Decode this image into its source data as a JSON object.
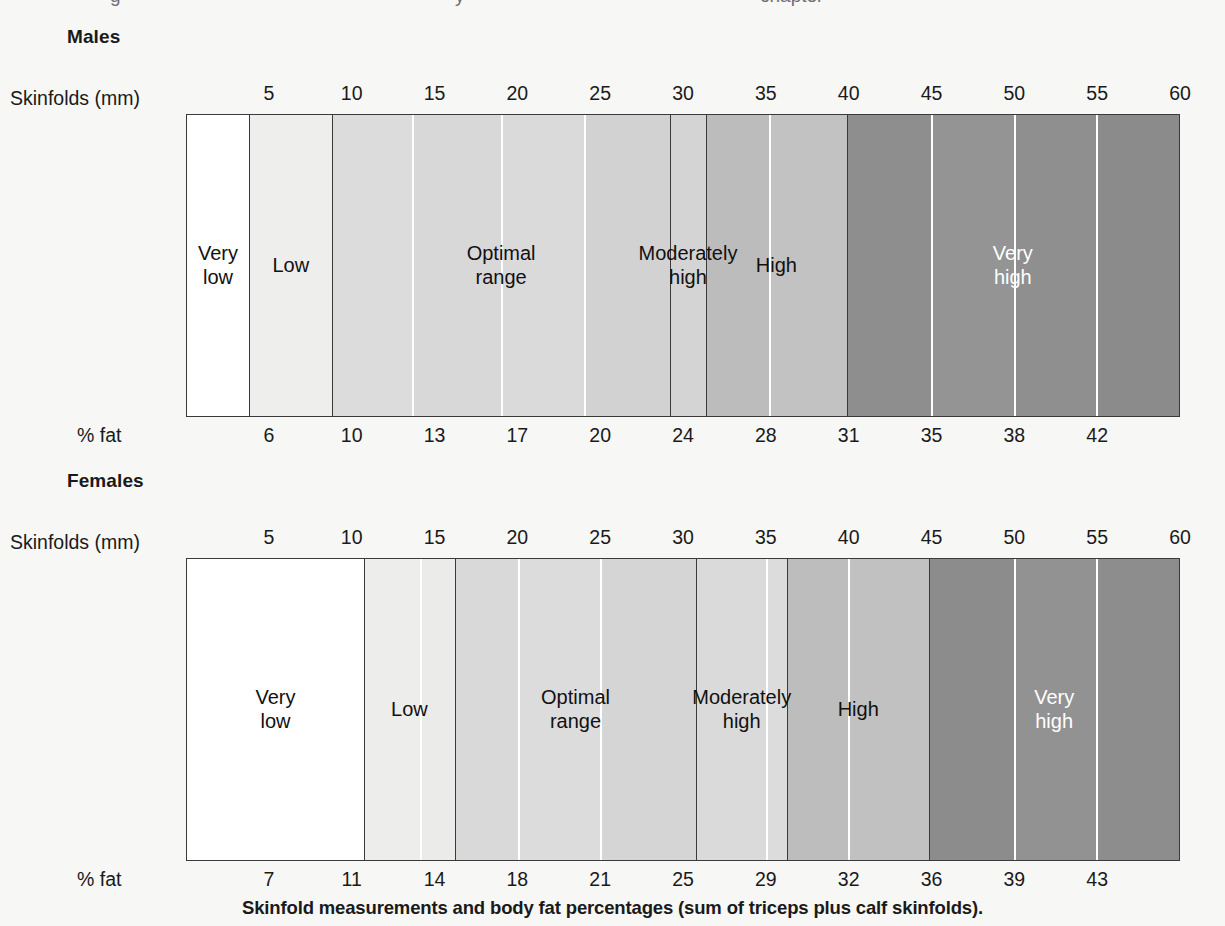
{
  "page": {
    "background": "#f7f7f5",
    "caption": "Skinfold measurements and body fat percentages (sum of triceps plus calf skinfolds).",
    "cutoff_top": {
      "a": "g",
      "b": "y",
      "c": "chapter"
    }
  },
  "axis": {
    "skinfold_label": "Skinfolds (mm)",
    "pct_label": "% fat",
    "min": 0,
    "max": 60,
    "ticks": [
      5,
      10,
      15,
      20,
      25,
      30,
      35,
      40,
      45,
      50,
      55,
      60
    ]
  },
  "palette": {
    "white": "#ffffff",
    "shade1": "#ededeb",
    "shade2": "#dedede",
    "shade3": "#d7d7d7",
    "shade4": "#dcdcdc",
    "shade5": "#d2d2d2",
    "shade6": "#bdbdbd",
    "shade7": "#c2c2c2",
    "shade8": "#8f8f8f",
    "shade9": "#949494",
    "shade10": "#8d8d8d",
    "shade11": "#8a8a8a",
    "border": "#3a3a3a",
    "divider_white": "#ffffff",
    "text_dark": "#111111",
    "text_light": "#ffffff"
  },
  "charts": [
    {
      "id": "males",
      "title": "Males",
      "pct_ticks": [
        6,
        10,
        13,
        17,
        20,
        24,
        28,
        31,
        35,
        38,
        42
      ],
      "pct_tick_mm": [
        5,
        10,
        15,
        20,
        25,
        30,
        35,
        40,
        45,
        50,
        55
      ],
      "categories": [
        {
          "name": "Very low",
          "label": "Very\nlow",
          "from_mm": 0,
          "to_mm": 3.75,
          "text": "dark"
        },
        {
          "name": "Low",
          "label": "Low",
          "from_mm": 3.75,
          "to_mm": 8.8,
          "text": "dark"
        },
        {
          "name": "Optimal range",
          "label": "Optimal\nrange",
          "from_mm": 8.8,
          "to_mm": 29.2,
          "text": "dark"
        },
        {
          "name": "Moderately high",
          "label": "Moderately\nhigh",
          "from_mm": 29.2,
          "to_mm": 31.4,
          "text": "dark"
        },
        {
          "name": "High",
          "label": "High",
          "from_mm": 31.4,
          "to_mm": 39.9,
          "text": "dark"
        },
        {
          "name": "Very high",
          "label": "Very\nhigh",
          "from_mm": 39.9,
          "to_mm": 60,
          "text": "light"
        }
      ],
      "bands": [
        {
          "from_mm": 0,
          "to_mm": 3.75,
          "color": "#ffffff",
          "sep": "none"
        },
        {
          "from_mm": 3.75,
          "to_mm": 8.8,
          "color": "#eeeeec",
          "sep": "major"
        },
        {
          "from_mm": 8.8,
          "to_mm": 13.6,
          "color": "#dcdcdc",
          "sep": "major"
        },
        {
          "from_mm": 13.6,
          "to_mm": 19.0,
          "color": "#d8d8d8",
          "sep": "minor"
        },
        {
          "from_mm": 19.0,
          "to_mm": 24.0,
          "color": "#dadada",
          "sep": "minor"
        },
        {
          "from_mm": 24.0,
          "to_mm": 29.2,
          "color": "#d2d2d2",
          "sep": "minor"
        },
        {
          "from_mm": 29.2,
          "to_mm": 31.4,
          "color": "#d4d4d4",
          "sep": "major"
        },
        {
          "from_mm": 31.4,
          "to_mm": 35.2,
          "color": "#bcbcbc",
          "sep": "major"
        },
        {
          "from_mm": 35.2,
          "to_mm": 39.9,
          "color": "#c2c2c2",
          "sep": "minor"
        },
        {
          "from_mm": 39.9,
          "to_mm": 45.0,
          "color": "#8e8e8e",
          "sep": "major"
        },
        {
          "from_mm": 45.0,
          "to_mm": 50.0,
          "color": "#949494",
          "sep": "minor"
        },
        {
          "from_mm": 50.0,
          "to_mm": 55.0,
          "color": "#8f8f8f",
          "sep": "minor"
        },
        {
          "from_mm": 55.0,
          "to_mm": 60.0,
          "color": "#8b8b8b",
          "sep": "minor"
        }
      ]
    },
    {
      "id": "females",
      "title": "Females",
      "pct_ticks": [
        7,
        11,
        14,
        18,
        21,
        25,
        29,
        32,
        36,
        39,
        43
      ],
      "pct_tick_mm": [
        5,
        10,
        15,
        20,
        25,
        30,
        35,
        40,
        45,
        50,
        55
      ],
      "categories": [
        {
          "name": "Very low",
          "label": "Very\nlow",
          "from_mm": 0,
          "to_mm": 10.7,
          "text": "dark"
        },
        {
          "name": "Low",
          "label": "Low",
          "from_mm": 10.7,
          "to_mm": 16.2,
          "text": "dark"
        },
        {
          "name": "Optimal range",
          "label": "Optimal\nrange",
          "from_mm": 16.2,
          "to_mm": 30.8,
          "text": "dark"
        },
        {
          "name": "Moderately high",
          "label": "Moderately\nhigh",
          "from_mm": 30.8,
          "to_mm": 36.3,
          "text": "dark"
        },
        {
          "name": "High",
          "label": "High",
          "from_mm": 36.3,
          "to_mm": 44.9,
          "text": "dark"
        },
        {
          "name": "Very high",
          "label": "Very\nhigh",
          "from_mm": 44.9,
          "to_mm": 60,
          "text": "light"
        }
      ],
      "bands": [
        {
          "from_mm": 0,
          "to_mm": 10.7,
          "color": "#ffffff",
          "sep": "none"
        },
        {
          "from_mm": 10.7,
          "to_mm": 14.1,
          "color": "#ededeb",
          "sep": "major"
        },
        {
          "from_mm": 14.1,
          "to_mm": 16.2,
          "color": "#ebebe9",
          "sep": "minor"
        },
        {
          "from_mm": 16.2,
          "to_mm": 20.0,
          "color": "#d9d9d9",
          "sep": "major"
        },
        {
          "from_mm": 20.0,
          "to_mm": 25.0,
          "color": "#dcdcdc",
          "sep": "minor"
        },
        {
          "from_mm": 25.0,
          "to_mm": 30.8,
          "color": "#d5d5d5",
          "sep": "minor"
        },
        {
          "from_mm": 30.8,
          "to_mm": 35.0,
          "color": "#dadada",
          "sep": "major"
        },
        {
          "from_mm": 35.0,
          "to_mm": 36.3,
          "color": "#dcdcdc",
          "sep": "minor"
        },
        {
          "from_mm": 36.3,
          "to_mm": 40.0,
          "color": "#bdbdbd",
          "sep": "major"
        },
        {
          "from_mm": 40.0,
          "to_mm": 44.9,
          "color": "#c1c1c1",
          "sep": "minor"
        },
        {
          "from_mm": 44.9,
          "to_mm": 50.0,
          "color": "#8c8c8c",
          "sep": "major"
        },
        {
          "from_mm": 50.0,
          "to_mm": 55.0,
          "color": "#929292",
          "sep": "minor"
        },
        {
          "from_mm": 55.0,
          "to_mm": 60.0,
          "color": "#8d8d8d",
          "sep": "minor"
        }
      ]
    }
  ],
  "chart_data": {
    "type": "bar",
    "title": "Skinfold measurements and body fat percentages (sum of triceps plus calf skinfolds).",
    "xlabel": "Skinfolds (mm)",
    "ylabel": "",
    "xlim": [
      0,
      60
    ],
    "grid": false,
    "legend": "none",
    "orientation": "horizontal-bands",
    "x_ticks": [
      5,
      10,
      15,
      20,
      25,
      30,
      35,
      40,
      45,
      50,
      55,
      60
    ],
    "series": [
      {
        "name": "Males",
        "secondary_axis_label": "% fat",
        "secondary_axis_ticks_at_mm": [
          5,
          10,
          15,
          20,
          25,
          30,
          35,
          40,
          45,
          50,
          55
        ],
        "secondary_axis_values": [
          6,
          10,
          13,
          17,
          20,
          24,
          28,
          31,
          35,
          38,
          42
        ],
        "classification_bands": [
          {
            "label": "Very low",
            "skinfold_mm": [
              0,
              3.75
            ],
            "approx_pct_fat": [
              0,
              5
            ]
          },
          {
            "label": "Low",
            "skinfold_mm": [
              3.75,
              8.8
            ],
            "approx_pct_fat": [
              5,
              9
            ]
          },
          {
            "label": "Optimal range",
            "skinfold_mm": [
              8.8,
              29.2
            ],
            "approx_pct_fat": [
              9,
              23
            ]
          },
          {
            "label": "Moderately high",
            "skinfold_mm": [
              29.2,
              31.4
            ],
            "approx_pct_fat": [
              23,
              25
            ]
          },
          {
            "label": "High",
            "skinfold_mm": [
              31.4,
              39.9
            ],
            "approx_pct_fat": [
              25,
              31
            ]
          },
          {
            "label": "Very high",
            "skinfold_mm": [
              39.9,
              60
            ],
            "approx_pct_fat": [
              31,
              45
            ]
          }
        ]
      },
      {
        "name": "Females",
        "secondary_axis_label": "% fat",
        "secondary_axis_ticks_at_mm": [
          5,
          10,
          15,
          20,
          25,
          30,
          35,
          40,
          45,
          50,
          55
        ],
        "secondary_axis_values": [
          7,
          11,
          14,
          18,
          21,
          25,
          29,
          32,
          36,
          39,
          43
        ],
        "classification_bands": [
          {
            "label": "Very low",
            "skinfold_mm": [
              0,
              10.7
            ],
            "approx_pct_fat": [
              0,
              12
            ]
          },
          {
            "label": "Low",
            "skinfold_mm": [
              10.7,
              16.2
            ],
            "approx_pct_fat": [
              12,
              15
            ]
          },
          {
            "label": "Optimal range",
            "skinfold_mm": [
              16.2,
              30.8
            ],
            "approx_pct_fat": [
              15,
              25
            ]
          },
          {
            "label": "Moderately high",
            "skinfold_mm": [
              30.8,
              36.3
            ],
            "approx_pct_fat": [
              25,
              29
            ]
          },
          {
            "label": "High",
            "skinfold_mm": [
              36.3,
              44.9
            ],
            "approx_pct_fat": [
              29,
              36
            ]
          },
          {
            "label": "Very high",
            "skinfold_mm": [
              44.9,
              60
            ],
            "approx_pct_fat": [
              36,
              46
            ]
          }
        ]
      }
    ]
  }
}
